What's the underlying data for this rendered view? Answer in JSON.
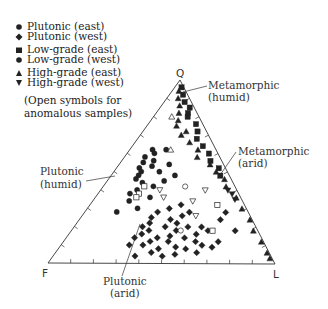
{
  "chart_data": {
    "type": "scatter",
    "subtype": "ternary",
    "title": "",
    "vertices": {
      "top": "Q",
      "bottom_left": "F",
      "bottom_right": "L"
    },
    "axis_ticks_per_side": 10,
    "legend": [
      {
        "label": "Plutonic (east)",
        "marker": "circle",
        "filled": true
      },
      {
        "label": "Plutonic (west)",
        "marker": "diamond",
        "filled": true
      },
      {
        "label": "Low-grade (east)",
        "marker": "square",
        "filled": true
      },
      {
        "label": "Low-grade (west)",
        "marker": "circle",
        "filled": true
      },
      {
        "label": "High-grade (east)",
        "marker": "triangle-up",
        "filled": true
      },
      {
        "label": "High-grade (west)",
        "marker": "triangle-down",
        "filled": true
      }
    ],
    "legend_note": [
      "(Open symbols for",
      "anomalous samples)"
    ],
    "field_annotations": [
      {
        "label": [
          "Metamorphic",
          "(humid)"
        ],
        "position": "near Q along Q-L edge"
      },
      {
        "label": [
          "Metamorphic",
          "(arid)"
        ],
        "position": "right side of Q-L edge"
      },
      {
        "label": [
          "Plutonic",
          "(humid)"
        ],
        "position": "left of Q-F edge"
      },
      {
        "label": [
          "Plutonic",
          "(arid)"
        ],
        "position": "below F-L edge"
      }
    ],
    "series": [
      {
        "name": "Plutonic (east) / Low-grade (west) circles",
        "marker": "circle",
        "filled": true,
        "points_qfl_pct": [
          [
            62,
            28,
            10
          ],
          [
            58,
            33,
            9
          ],
          [
            55,
            35,
            10
          ],
          [
            52,
            38,
            10
          ],
          [
            60,
            28,
            12
          ],
          [
            56,
            30,
            14
          ],
          [
            50,
            38,
            12
          ],
          [
            48,
            40,
            12
          ],
          [
            53,
            32,
            15
          ],
          [
            46,
            42,
            12
          ],
          [
            44,
            40,
            16
          ],
          [
            50,
            30,
            20
          ],
          [
            42,
            36,
            22
          ],
          [
            40,
            44,
            16
          ],
          [
            38,
            48,
            14
          ],
          [
            45,
            30,
            25
          ],
          [
            36,
            40,
            24
          ],
          [
            34,
            50,
            16
          ],
          [
            48,
            24,
            28
          ],
          [
            30,
            48,
            22
          ],
          [
            62,
            22,
            16
          ],
          [
            54,
            24,
            22
          ],
          [
            28,
            58,
            14
          ]
        ]
      },
      {
        "name": "Plutonic (west)",
        "marker": "diamond",
        "filled": true,
        "points_qfl_pct": [
          [
            28,
            40,
            32
          ],
          [
            25,
            44,
            31
          ],
          [
            22,
            46,
            32
          ],
          [
            20,
            50,
            30
          ],
          [
            18,
            48,
            34
          ],
          [
            16,
            52,
            32
          ],
          [
            14,
            46,
            40
          ],
          [
            12,
            50,
            38
          ],
          [
            20,
            40,
            40
          ],
          [
            24,
            36,
            40
          ],
          [
            10,
            54,
            36
          ],
          [
            8,
            48,
            44
          ],
          [
            15,
            40,
            45
          ],
          [
            12,
            42,
            46
          ],
          [
            18,
            36,
            46
          ],
          [
            6,
            52,
            42
          ],
          [
            9,
            40,
            51
          ],
          [
            14,
            34,
            52
          ],
          [
            20,
            30,
            50
          ],
          [
            22,
            34,
            44
          ],
          [
            8,
            36,
            56
          ],
          [
            12,
            30,
            58
          ],
          [
            16,
            28,
            56
          ],
          [
            5,
            42,
            53
          ],
          [
            10,
            28,
            62
          ],
          [
            26,
            30,
            44
          ],
          [
            30,
            34,
            36
          ],
          [
            4,
            48,
            48
          ],
          [
            18,
            22,
            60
          ],
          [
            6,
            32,
            62
          ],
          [
            9,
            24,
            67
          ],
          [
            12,
            20,
            68
          ],
          [
            20,
            24,
            56
          ],
          [
            28,
            26,
            46
          ],
          [
            32,
            28,
            40
          ],
          [
            14,
            56,
            30
          ],
          [
            10,
            60,
            30
          ],
          [
            4,
            60,
            36
          ],
          [
            28,
            10,
            62
          ],
          [
            24,
            14,
            62
          ],
          [
            18,
            10,
            72
          ]
        ]
      },
      {
        "name": "Low-grade (east)",
        "marker": "square",
        "filled": true,
        "points_qfl_pct": [
          [
            96,
            1,
            3
          ],
          [
            92,
            2,
            6
          ],
          [
            88,
            3,
            9
          ],
          [
            85,
            2,
            13
          ],
          [
            82,
            4,
            14
          ],
          [
            80,
            5,
            15
          ],
          [
            76,
            3,
            21
          ],
          [
            72,
            4,
            24
          ],
          [
            68,
            6,
            26
          ],
          [
            64,
            5,
            31
          ],
          [
            60,
            4,
            36
          ],
          [
            56,
            5,
            39
          ],
          [
            52,
            3,
            45
          ],
          [
            48,
            4,
            48
          ]
        ]
      },
      {
        "name": "High-grade (east)",
        "marker": "triangle-up",
        "filled": true,
        "points_qfl_pct": [
          [
            94,
            3,
            3
          ],
          [
            90,
            5,
            5
          ],
          [
            86,
            6,
            8
          ],
          [
            82,
            8,
            10
          ],
          [
            78,
            10,
            12
          ],
          [
            75,
            12,
            13
          ],
          [
            72,
            9,
            19
          ],
          [
            70,
            12,
            18
          ],
          [
            66,
            10,
            24
          ],
          [
            62,
            8,
            30
          ],
          [
            58,
            10,
            32
          ],
          [
            54,
            6,
            40
          ],
          [
            50,
            5,
            45
          ],
          [
            46,
            3,
            51
          ],
          [
            42,
            4,
            54
          ],
          [
            36,
            2,
            62
          ],
          [
            30,
            2,
            68
          ],
          [
            24,
            1,
            75
          ],
          [
            18,
            2,
            80
          ],
          [
            12,
            1,
            87
          ],
          [
            6,
            1,
            93
          ],
          [
            3,
            1,
            96
          ]
        ]
      },
      {
        "name": "High-grade (west)",
        "marker": "triangle-down",
        "filled": true,
        "points_qfl_pct": [
          [
            40,
            4,
            56
          ],
          [
            38,
            3,
            59
          ],
          [
            35,
            3,
            62
          ]
        ]
      },
      {
        "name": "Anomalous (open symbols)",
        "marker": "mixed-open",
        "points": [
          {
            "marker": "triangle-up",
            "qfl": [
              80,
              12,
              8
            ]
          },
          {
            "marker": "triangle-up",
            "qfl": [
              62,
              20,
              18
            ]
          },
          {
            "marker": "square",
            "qfl": [
              42,
              40,
              18
            ]
          },
          {
            "marker": "square",
            "qfl": [
              38,
              44,
              18
            ]
          },
          {
            "marker": "square",
            "qfl": [
              36,
              46,
              18
            ]
          },
          {
            "marker": "circle",
            "qfl": [
              42,
              22,
              36
            ]
          },
          {
            "marker": "triangle-down",
            "qfl": [
              40,
              34,
              26
            ]
          },
          {
            "marker": "triangle-down",
            "qfl": [
              36,
              34,
              30
            ]
          },
          {
            "marker": "triangle-down",
            "qfl": [
              34,
              22,
              44
            ]
          },
          {
            "marker": "triangle-down",
            "qfl": [
              26,
              24,
              50
            ]
          },
          {
            "marker": "triangle-down",
            "qfl": [
              40,
              14,
              46
            ]
          },
          {
            "marker": "square",
            "qfl": [
              18,
              20,
              62
            ]
          },
          {
            "marker": "square",
            "qfl": [
              32,
              12,
              56
            ]
          },
          {
            "marker": "circle",
            "qfl": [
              18,
              34,
              48
            ]
          }
        ]
      }
    ]
  },
  "legend": {
    "items": [
      {
        "label": "Plutonic (east)"
      },
      {
        "label": "Plutonic (west)"
      },
      {
        "label": "Low-grade (east)"
      },
      {
        "label": "Low-grade (west)"
      },
      {
        "label": "High-grade (east)"
      },
      {
        "label": "High-grade (west)"
      }
    ],
    "note_line1": "(Open symbols for",
    "note_line2": "anomalous samples)"
  },
  "labels": {
    "q": "Q",
    "f": "F",
    "l": "L",
    "meta_humid_1": "Metamorphic",
    "meta_humid_2": "(humid)",
    "meta_arid_1": "Metamorphic",
    "meta_arid_2": "(arid)",
    "plut_humid_1": "Plutonic",
    "plut_humid_2": "(humid)",
    "plut_arid_1": "Plutonic",
    "plut_arid_2": "(arid)"
  },
  "colors": {
    "ink": "#222222",
    "axis": "#333333",
    "background": "#ffffff"
  }
}
